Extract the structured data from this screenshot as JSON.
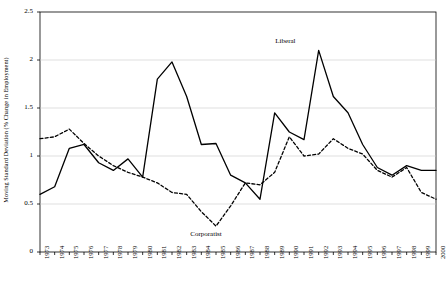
{
  "chart_data": {
    "type": "line",
    "title": "",
    "xlabel": "",
    "ylabel": "Moving Standard Deviation (% Change in Employment)",
    "ylim": [
      0,
      2.5
    ],
    "yticks": [
      0,
      0.5,
      1,
      1.5,
      2,
      2.5
    ],
    "ytick_labels": [
      "0",
      "0.5",
      "1",
      "1.5",
      "2",
      "2.5"
    ],
    "grid": true,
    "legend": "none",
    "categories": [
      "1973",
      "1974",
      "1975",
      "1976",
      "1977",
      "1978",
      "1979",
      "1980",
      "1981",
      "1982",
      "1983",
      "1984",
      "1985",
      "1986",
      "1987",
      "1988",
      "1989",
      "1990",
      "1991",
      "1992",
      "1993",
      "1994",
      "1995",
      "1996",
      "1997",
      "1998",
      "1999",
      "2000"
    ],
    "annotations": [
      {
        "name": "liberal-label",
        "text": "Liberal",
        "x": 1990,
        "y": 2.18
      },
      {
        "name": "corporatist-label",
        "text": "Corporatist",
        "x": 1984.2,
        "y": 0.17
      }
    ],
    "series": [
      {
        "name": "Liberal",
        "style": "solid",
        "values": [
          0.6,
          0.68,
          1.08,
          1.12,
          0.93,
          0.85,
          0.97,
          0.78,
          1.8,
          1.98,
          1.62,
          1.12,
          1.13,
          0.8,
          0.72,
          0.55,
          1.45,
          1.25,
          1.17,
          2.1,
          1.62,
          1.45,
          1.12,
          0.88,
          0.8,
          0.9,
          0.85,
          0.85
        ]
      },
      {
        "name": "Corporatist",
        "style": "dashed",
        "values": [
          1.18,
          1.2,
          1.28,
          1.13,
          1.0,
          0.9,
          0.83,
          0.78,
          0.72,
          0.62,
          0.6,
          0.42,
          0.27,
          0.48,
          0.72,
          0.7,
          0.83,
          1.2,
          1.0,
          1.02,
          1.18,
          1.08,
          1.02,
          0.85,
          0.78,
          0.88,
          0.62,
          0.55
        ]
      }
    ]
  }
}
